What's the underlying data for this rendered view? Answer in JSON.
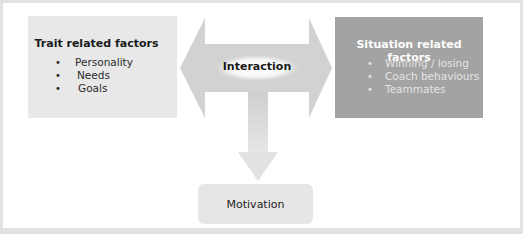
{
  "diagram": {
    "left_box": {
      "title": "Trait related factors",
      "bullet": "•",
      "items": [
        "Personality",
        "Needs",
        "Goals"
      ]
    },
    "right_box": {
      "title": "Situation related factors",
      "bullet": "•",
      "items": [
        "Winning / losing",
        "Coach behaviours",
        "Teammates"
      ]
    },
    "center": {
      "label": "Interaction"
    },
    "output": {
      "label": "Motivation"
    },
    "colors": {
      "left_box": "#e8e8e8",
      "right_box": "#a3a3a3",
      "arrow": "#d4d4d4",
      "output_box": "#e6e6e6",
      "frame": "#e2e2e2"
    }
  }
}
